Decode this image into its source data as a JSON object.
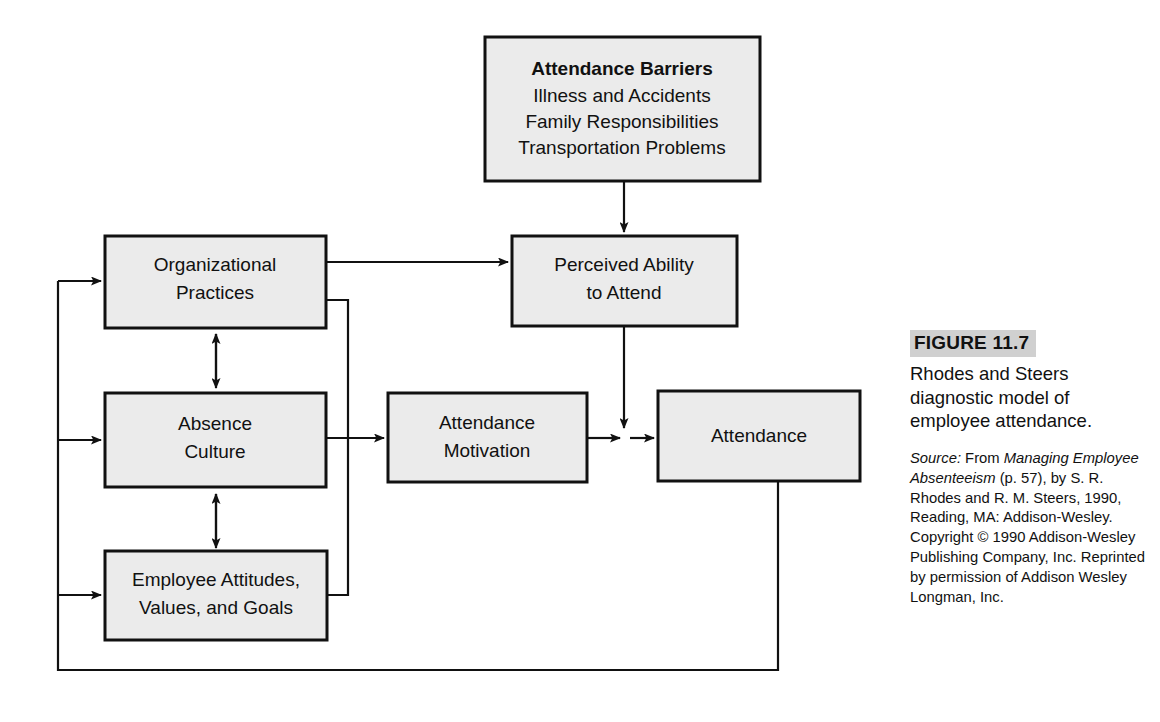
{
  "figure": {
    "number_label": "FIGURE 11.7",
    "caption": "Rhodes and Steers diagnostic model of employee attendance.",
    "source": {
      "label": "Source:",
      "intro": " From ",
      "title": "Managing Employee Absenteeism",
      "rest": " (p. 57), by S. R. Rhodes and R. M. Steers, 1990, Reading, MA: Addison-Wesley. Copyright © 1990 Addison-Wesley Publishing Company, Inc. Reprinted by permission of Addison Wesley Longman, Inc."
    }
  },
  "diagram": {
    "type": "flowchart",
    "nodes": [
      {
        "id": "attendance-barriers",
        "heading": "Attendance Barriers",
        "lines": [
          "Illness and Accidents",
          "Family Responsibilities",
          "Transportation Problems"
        ]
      },
      {
        "id": "organizational-practices",
        "lines": [
          "Organizational",
          "Practices"
        ]
      },
      {
        "id": "perceived-ability",
        "lines": [
          "Perceived Ability",
          "to Attend"
        ]
      },
      {
        "id": "absence-culture",
        "lines": [
          "Absence",
          "Culture"
        ]
      },
      {
        "id": "attendance-motivation",
        "lines": [
          "Attendance",
          "Motivation"
        ]
      },
      {
        "id": "attendance",
        "lines": [
          "Attendance"
        ]
      },
      {
        "id": "employee-attitudes",
        "lines": [
          "Employee Attitudes,",
          "Values, and Goals"
        ]
      }
    ],
    "edges": [
      {
        "from": "attendance-barriers",
        "to": "perceived-ability",
        "style": "arrow"
      },
      {
        "from": "organizational-practices",
        "to": "perceived-ability",
        "style": "arrow"
      },
      {
        "from": "organizational-practices",
        "to": "absence-culture",
        "style": "double-arrow"
      },
      {
        "from": "absence-culture",
        "to": "employee-attitudes",
        "style": "double-arrow"
      },
      {
        "from": "organizational-practices",
        "to": "employee-attitudes",
        "style": "elbow"
      },
      {
        "from": "absence-culture",
        "to": "attendance-motivation",
        "style": "arrow"
      },
      {
        "from": "attendance-motivation",
        "to": "attendance",
        "style": "arrow"
      },
      {
        "from": "perceived-ability",
        "to": "attendance",
        "style": "arrow"
      },
      {
        "from": "attendance",
        "to": "organizational-practices",
        "style": "feedback"
      },
      {
        "from": "attendance",
        "to": "absence-culture",
        "style": "feedback"
      },
      {
        "from": "attendance",
        "to": "employee-attitudes",
        "style": "feedback"
      }
    ]
  },
  "colors": {
    "box_fill": "#ebebeb",
    "stroke": "#111111",
    "figure_band": "#d0d0d0",
    "background": "#ffffff"
  }
}
